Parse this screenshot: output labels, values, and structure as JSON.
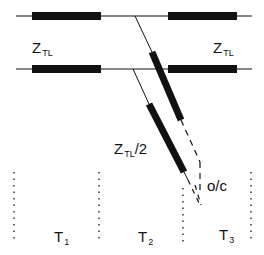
{
  "diagram": {
    "line_color": "#111111",
    "labels": {
      "z_left": {
        "main": "Z",
        "sub": "TL"
      },
      "z_right": {
        "main": "Z",
        "sub": "TL"
      },
      "z_half": {
        "main": "Z",
        "sub": "TL",
        "suffix": "/2"
      },
      "open_circuit": "o/c",
      "t1": {
        "main": "T",
        "sub": "1"
      },
      "t2": {
        "main": "T",
        "sub": "2"
      },
      "t3": {
        "main": "T",
        "sub": "3"
      }
    }
  }
}
